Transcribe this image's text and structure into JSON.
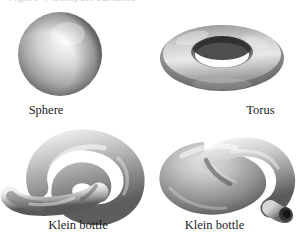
{
  "figure": {
    "top_partial_caption": "Figure 4   Compact surfaces",
    "background_color": "#ffffff",
    "caption_color": "#1c1c1c",
    "surface_light_gray": "#f2f2f2",
    "surface_mid_gray": "#9a9a9a",
    "surface_dark_gray": "#3a3a3a",
    "panels": [
      {
        "id": "sphere",
        "label": "Sphere",
        "icon": "sphere-surface-icon",
        "shading": "radial highlight upper-right, dark lower-left rim"
      },
      {
        "id": "torus",
        "label": "Torus",
        "icon": "torus-surface-icon",
        "shading": "tilted ring, white hole, dark inner upper rim"
      },
      {
        "id": "klein-bottle-left",
        "label": "Klein bottle",
        "icon": "klein-bottle-surface-icon",
        "shading": "teardrop loop, tapered neck to lower-left"
      },
      {
        "id": "klein-bottle-right",
        "label": "Klein bottle",
        "icon": "klein-bottle-surface-icon",
        "shading": "bulbous body, neck passing through, opening lower-right"
      }
    ]
  }
}
